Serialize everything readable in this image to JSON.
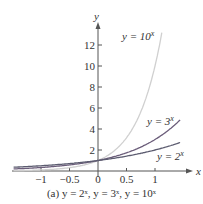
{
  "chart_data": {
    "type": "line",
    "title": "",
    "caption": "(a) y = 2^x, y = 3^x, y = 10^x",
    "xlabel": "x",
    "ylabel": "y",
    "xlim": [
      -1.4,
      1.45
    ],
    "ylim": [
      0,
      14
    ],
    "xticks": [
      "-1",
      "-0.5",
      "0",
      "0.5",
      "1"
    ],
    "yticks": [
      "2",
      "4",
      "6",
      "8",
      "10",
      "12"
    ],
    "grid": false,
    "series": [
      {
        "name": "y = 10^x",
        "color": "#cfcfcf",
        "x": [
          -1.4,
          -1,
          -0.5,
          0,
          0.5,
          1,
          1.13
        ],
        "y": [
          0.04,
          0.1,
          0.32,
          1,
          3.16,
          10,
          13.5
        ]
      },
      {
        "name": "y = 3^x",
        "color": "#6a5a78",
        "x": [
          -1.4,
          -1,
          -0.5,
          0,
          0.5,
          1,
          1.45
        ],
        "y": [
          0.21,
          0.33,
          0.58,
          1,
          1.73,
          3,
          4.92
        ]
      },
      {
        "name": "y = 2^x",
        "color": "#5a5a6e",
        "x": [
          -1.4,
          -1,
          -0.5,
          0,
          0.5,
          1,
          1.45
        ],
        "y": [
          0.38,
          0.5,
          0.71,
          1,
          1.41,
          2,
          2.73
        ]
      }
    ],
    "annotations": [
      "y = 10^x",
      "y = 3^x",
      "y = 2^x"
    ]
  },
  "labels": {
    "x_axis": "x",
    "y_axis": "y",
    "ann10": "y = 10",
    "ann3": "y = 3",
    "ann2": "y = 2",
    "sup": "x",
    "caption": "(a) y = 2ˣ, y = 3ˣ, y = 10ˣ",
    "xticks": [
      "−1",
      "−0.5",
      "0",
      "0.5",
      "1"
    ],
    "yticks": [
      "2",
      "4",
      "6",
      "8",
      "10",
      "12"
    ]
  }
}
